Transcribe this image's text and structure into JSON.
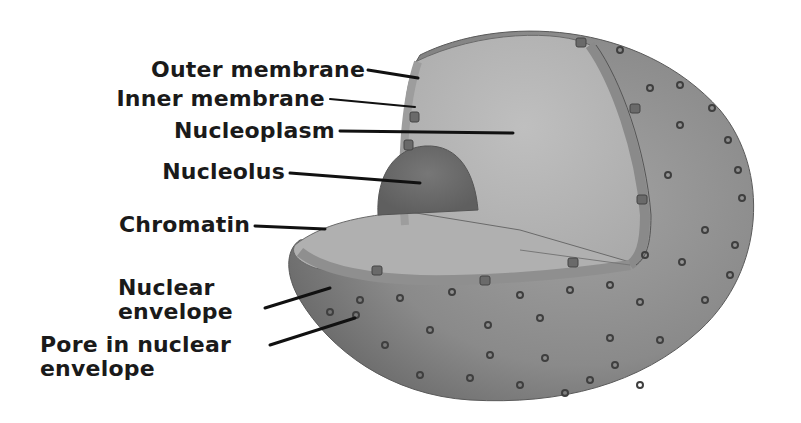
{
  "diagram": {
    "labels": [
      {
        "id": "outer_membrane",
        "text": "Outer membrane"
      },
      {
        "id": "inner_membrane",
        "text": "Inner membrane"
      },
      {
        "id": "nucleoplasm",
        "text": "Nucleoplasm"
      },
      {
        "id": "nucleolus",
        "text": "Nucleolus"
      },
      {
        "id": "chromatin",
        "text": "Chromatin"
      },
      {
        "id": "nuclear_envelope",
        "text": "Nuclear envelope",
        "lines": [
          "Nuclear",
          "envelope"
        ]
      },
      {
        "id": "pore",
        "text": "Pore in nuclear envelope",
        "lines": [
          "Pore in nuclear",
          "envelope"
        ]
      }
    ],
    "colors": {
      "background": "#ffffff",
      "text": "#1a1a1a",
      "leader_line": "#111111",
      "outer_shell": "#8e8e8e",
      "cut_face": "#b5b5b5",
      "nucleolus": "#6f6f6f",
      "envelope_band": "#9a9a9a",
      "pore": "#4a4a4a"
    }
  }
}
